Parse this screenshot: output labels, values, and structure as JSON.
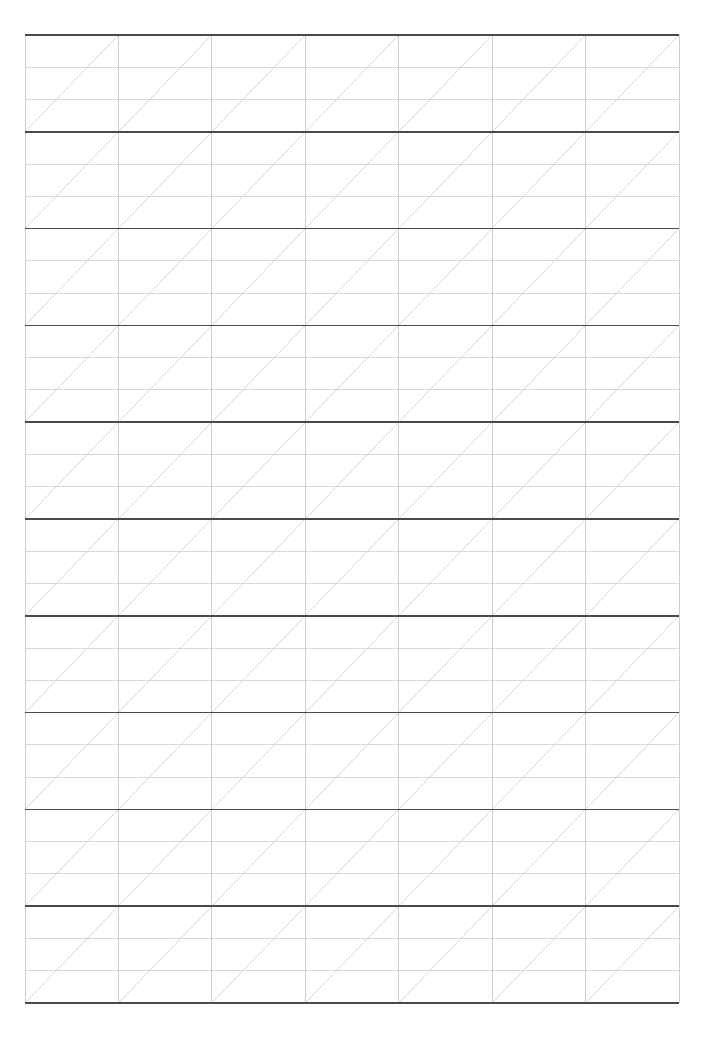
{
  "page": {
    "background_color": "#ffffff",
    "width": 713,
    "height": 1049
  },
  "grid": {
    "name": "calligraphy-practice-grid",
    "origin_x": 25,
    "origin_y": 35,
    "width": 654,
    "height": 968,
    "columns": 7,
    "rows": 10,
    "cell_width": 93.43,
    "cell_height": 96.8,
    "subdivisions_per_row": 3,
    "diagonal_direction": "bottom-left-to-top-right",
    "diagonals_per_cell": 1,
    "colors": {
      "row_separator": "#4a4a4a",
      "row_separator_width": 1.6,
      "inner_horizontal": "#cfcfcf",
      "inner_horizontal_width": 0.8,
      "vertical": "#c2c2c2",
      "vertical_width": 0.8,
      "diagonal": "#cacaca",
      "diagonal_width": 0.8,
      "background": "#ffffff"
    }
  }
}
